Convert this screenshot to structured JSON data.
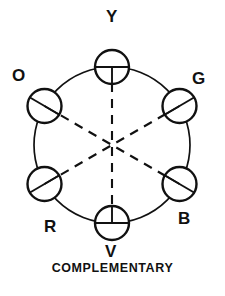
{
  "figure": {
    "name": "complementary-color-wheel",
    "caption": "COMPLEMENTARY",
    "stroke_color": "#111111",
    "background_color": "#ffffff"
  },
  "wheel": {
    "center_x": 112,
    "center_y": 145,
    "radius": 78,
    "node_radius": 17,
    "nodes": [
      {
        "id": "yellow",
        "label": "Y",
        "angle_deg": 90,
        "marker": "cross-down",
        "label_x": 106,
        "label_y": 8
      },
      {
        "id": "green",
        "label": "G",
        "angle_deg": 30,
        "marker": "diagonal-ne",
        "label_x": 192,
        "label_y": 70
      },
      {
        "id": "blue",
        "label": "B",
        "angle_deg": -30,
        "marker": "diagonal-ne",
        "label_x": 178,
        "label_y": 210
      },
      {
        "id": "violet",
        "label": "V",
        "angle_deg": -90,
        "marker": "cross-up",
        "label_x": 105,
        "label_y": 243
      },
      {
        "id": "red",
        "label": "R",
        "angle_deg": 210,
        "marker": "diagonal-nw",
        "label_x": 44,
        "label_y": 218
      },
      {
        "id": "orange",
        "label": "O",
        "angle_deg": 150,
        "marker": "diagonal-nw",
        "label_x": 12,
        "label_y": 67
      }
    ],
    "complementary_pairs": [
      {
        "from": "yellow",
        "to": "violet"
      },
      {
        "from": "green",
        "to": "red"
      },
      {
        "from": "blue",
        "to": "orange"
      }
    ],
    "dash_pattern": "9 7"
  }
}
